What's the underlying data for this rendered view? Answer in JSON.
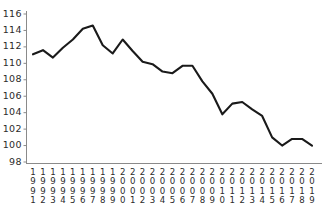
{
  "chart_data": {
    "type": "line",
    "title": "",
    "subtitle": "",
    "xlabel": "",
    "ylabel": "",
    "legend": [],
    "legend_position": "none",
    "grid": false,
    "line_color": "#1a1a1a",
    "axis_color": "#8a8a8a",
    "text_color": "#2b2b2b",
    "ylim": [
      98,
      116
    ],
    "ytick_step": 2,
    "yticks": [
      116,
      114,
      112,
      110,
      108,
      106,
      104,
      102,
      100,
      98
    ],
    "ytick_labels": [
      "116",
      "114",
      "112",
      "110",
      "108",
      "106",
      "104",
      "102",
      "100",
      "98"
    ],
    "categories": [
      "1991",
      "1992",
      "1993",
      "1994",
      "1995",
      "1996",
      "1997",
      "1998",
      "1999",
      "2000",
      "2001",
      "2002",
      "2003",
      "2004",
      "2005",
      "2006",
      "2007",
      "2008",
      "2009",
      "2010",
      "2011",
      "2012",
      "2013",
      "2014",
      "2015",
      "2016",
      "2017",
      "2018",
      "2019"
    ],
    "xtick_orientation": "vertical-stacked-digits",
    "values": [
      111.1,
      111.6,
      110.7,
      111.9,
      112.9,
      114.2,
      114.6,
      112.2,
      111.2,
      112.9,
      111.5,
      110.2,
      109.9,
      109.0,
      108.8,
      109.7,
      109.7,
      107.8,
      106.3,
      103.8,
      105.1,
      105.3,
      104.4,
      103.6,
      101.0,
      100.0,
      100.8,
      100.8,
      100.0
    ],
    "series": [
      {
        "name": "series-1",
        "values": [
          111.1,
          111.6,
          110.7,
          111.9,
          112.9,
          114.2,
          114.6,
          112.2,
          111.2,
          112.9,
          111.5,
          110.2,
          109.9,
          109.0,
          108.8,
          109.7,
          109.7,
          107.8,
          106.3,
          103.8,
          105.1,
          105.3,
          104.4,
          103.6,
          101.0,
          100.0,
          100.8,
          100.8,
          100.0
        ]
      }
    ]
  }
}
